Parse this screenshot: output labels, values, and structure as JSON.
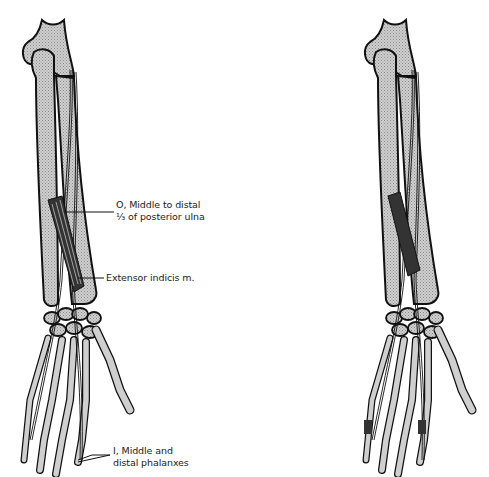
{
  "figure": {
    "left_panel": {
      "name": "Forearm and hand, posterior view, with extensor indicis muscle labeled",
      "labels": {
        "origin_line1": "O, Middle to distal",
        "origin_line2": "⅓ of posterior ulna",
        "muscle": "Extensor indicis m.",
        "insertion_line1": "I, Middle and",
        "insertion_line2": "distal phalanxes"
      }
    },
    "right_panel": {
      "name": "Forearm and hand, posterior view, unlabeled"
    },
    "colors": {
      "bone_fill": "#c8c8c8",
      "outline": "#111111",
      "background": "#ffffff"
    }
  }
}
